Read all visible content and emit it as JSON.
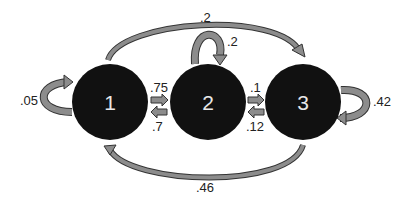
{
  "diagram": {
    "type": "markov-chain",
    "nodes": [
      {
        "id": "1",
        "label": "1"
      },
      {
        "id": "2",
        "label": "2"
      },
      {
        "id": "3",
        "label": "3"
      }
    ],
    "edges": [
      {
        "from": "1",
        "to": "1",
        "label": ".05"
      },
      {
        "from": "1",
        "to": "2",
        "label": ".75"
      },
      {
        "from": "2",
        "to": "1",
        "label": ".7"
      },
      {
        "from": "1",
        "to": "3",
        "label": ".2"
      },
      {
        "from": "2",
        "to": "2",
        "label": ".2"
      },
      {
        "from": "2",
        "to": "3",
        "label": ".1"
      },
      {
        "from": "3",
        "to": "2",
        "label": ".12"
      },
      {
        "from": "3",
        "to": "3",
        "label": ".42"
      },
      {
        "from": "3",
        "to": "1",
        "label": ".46"
      }
    ],
    "colors": {
      "node_fill": "#111111",
      "node_text": "#e8e8e8",
      "arrow_fill": "#8c8c8c",
      "arrow_stroke": "#333333",
      "label": "#222222"
    }
  }
}
